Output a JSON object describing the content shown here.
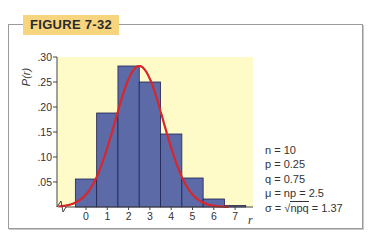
{
  "figure": {
    "label": "FIGURE 7-32"
  },
  "chart_data": {
    "type": "bar",
    "title": "",
    "xlabel": "r",
    "ylabel": "P(r)",
    "categories": [
      "0",
      "1",
      "2",
      "3",
      "4",
      "5",
      "6",
      "7"
    ],
    "values": [
      0.056,
      0.188,
      0.282,
      0.25,
      0.146,
      0.058,
      0.016,
      0.003
    ],
    "yticks": [
      ".05",
      ".10",
      ".15",
      ".20",
      ".25",
      ".30"
    ],
    "ylim": [
      0,
      0.3
    ],
    "overlay": {
      "type": "normal-curve",
      "mean": 2.5,
      "sd": 1.37,
      "color": "#d9262c"
    },
    "bar_color": "#5d6aa8",
    "background_color": "#fffbc9",
    "grid": false,
    "legend": null
  },
  "params": {
    "n": "n = 10",
    "p": "p = 0.25",
    "q": "q = 0.75",
    "mu": "μ = np = 2.5",
    "sigma_pre": "σ = ",
    "sigma_root": "npq",
    "sigma_post": " = 1.37"
  }
}
